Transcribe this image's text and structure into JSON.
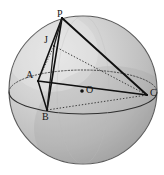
{
  "figure": {
    "type": "geometry-diagram",
    "canvas": {
      "width": 164,
      "height": 175
    },
    "background_color": "#ffffff",
    "sphere": {
      "name": "sphere",
      "center": {
        "x": 83,
        "y": 90
      },
      "radius": 74,
      "fill_light": "#d6d6d6",
      "fill_dark": "#a9a9a9",
      "outline_color": "#5a5a5a",
      "outline_width": 1.1
    },
    "equator": {
      "name": "equator-ellipse",
      "center": {
        "x": 83,
        "y": 92
      },
      "rx": 74,
      "ry": 22,
      "front_style": "solid",
      "back_style": "dotted",
      "color": "#3a3a3a"
    },
    "center_point": {
      "name": "center-O",
      "label": "O",
      "x": 82,
      "y": 91,
      "dot_radius": 1.8,
      "dot_color": "#111111"
    },
    "points": [
      {
        "id": "P",
        "label": "P",
        "x": 62,
        "y": 18,
        "label_x": 57,
        "label_y": 9
      },
      {
        "id": "J",
        "label": "J",
        "x": 54,
        "y": 46,
        "label_x": 44,
        "label_y": 35
      },
      {
        "id": "A",
        "label": "A",
        "x": 38,
        "y": 81,
        "label_x": 26,
        "label_y": 70
      },
      {
        "id": "B",
        "label": "B",
        "x": 47,
        "y": 110,
        "label_x": 42,
        "label_y": 112
      },
      {
        "id": "C",
        "label": "C",
        "x": 147,
        "y": 95,
        "label_x": 150,
        "label_y": 88
      }
    ],
    "edges": [
      {
        "name": "edge-P-A",
        "from": "P",
        "to": "A",
        "style": "solid",
        "width": 1.6,
        "color": "#101010"
      },
      {
        "name": "edge-P-B",
        "from": "P",
        "to": "B",
        "style": "solid",
        "width": 1.6,
        "color": "#101010"
      },
      {
        "name": "edge-P-C",
        "from": "P",
        "to": "C",
        "style": "solid",
        "width": 1.9,
        "color": "#101010"
      },
      {
        "name": "edge-P-J",
        "from": "P",
        "to": "J",
        "style": "solid",
        "width": 1.3,
        "color": "#202020"
      },
      {
        "name": "edge-J-B",
        "from": "J",
        "to": "B",
        "style": "solid",
        "width": 1.3,
        "color": "#202020"
      },
      {
        "name": "edge-A-B",
        "from": "A",
        "to": "B",
        "style": "solid",
        "width": 1.5,
        "color": "#101010"
      },
      {
        "name": "edge-A-C",
        "from": "A",
        "to": "C",
        "style": "solid",
        "width": 1.7,
        "color": "#101010"
      },
      {
        "name": "edge-J-C",
        "from": "J",
        "to": "C",
        "style": "dotted",
        "width": 1.0,
        "color": "#3a3a3a"
      },
      {
        "name": "edge-B-C",
        "from": "B",
        "to": "C",
        "style": "dotted",
        "width": 1.0,
        "color": "#3a3a3a"
      },
      {
        "name": "edge-A-J",
        "from": "A",
        "to": "J",
        "style": "dotted",
        "width": 0.9,
        "color": "#4a4a4a"
      }
    ],
    "labels": {
      "P": "P",
      "J": "J",
      "A": "A",
      "B": "B",
      "C": "C",
      "O": "O"
    }
  }
}
